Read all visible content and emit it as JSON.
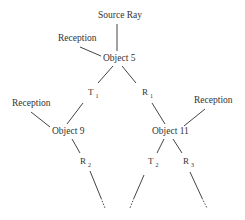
{
  "diagram": {
    "type": "ray-tracing-tree",
    "nodes": {
      "source": "Source Ray",
      "object5": "Object 5",
      "object9": "Object 9",
      "object11": "Object 11",
      "reception_top": "Reception",
      "reception_left": "Reception",
      "reception_right": "Reception"
    },
    "edges": {
      "t1": {
        "letter": "T",
        "sub": "1"
      },
      "r1": {
        "letter": "R",
        "sub": "1"
      },
      "r2": {
        "letter": "R",
        "sub": "2"
      },
      "t2": {
        "letter": "T",
        "sub": "2"
      },
      "r3": {
        "letter": "R",
        "sub": "3"
      }
    },
    "colors": {
      "line": "#444444",
      "text": "#333333",
      "background": "#ffffff"
    }
  }
}
